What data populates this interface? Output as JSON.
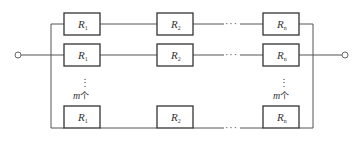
{
  "diagram": {
    "type": "circuit",
    "columns": [
      {
        "label": "R",
        "subscript": "1"
      },
      {
        "label": "R",
        "subscript": "2"
      },
      {
        "label": "R",
        "subscript": "n"
      }
    ],
    "rows": [
      {
        "id": "row-1",
        "resistors": [
          {
            "label": "R",
            "sub": "1"
          },
          {
            "label": "R",
            "sub": "2"
          },
          {
            "label": "R",
            "sub": "n"
          }
        ]
      },
      {
        "id": "row-2",
        "resistors": [
          {
            "label": "R",
            "sub": "1"
          },
          {
            "label": "R",
            "sub": "2"
          },
          {
            "label": "R",
            "sub": "n"
          }
        ]
      },
      {
        "id": "row-m",
        "resistors": [
          {
            "label": "R",
            "sub": "1"
          },
          {
            "label": "R",
            "sub": "2"
          },
          {
            "label": "R",
            "sub": "n"
          }
        ]
      }
    ],
    "series_ellipsis": "···",
    "branch_count_label": {
      "var": "m",
      "unit": "个"
    },
    "vertical_ellipsis": "⋮"
  }
}
